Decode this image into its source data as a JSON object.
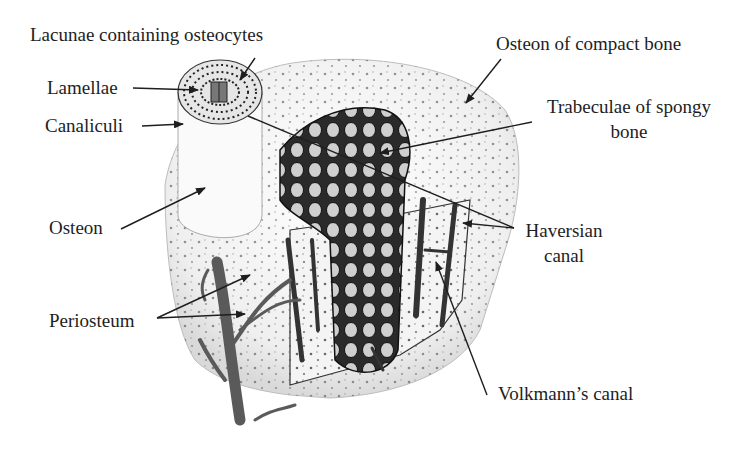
{
  "diagram": {
    "colors": {
      "ink": "#1e1e1e",
      "bone_fill": "#f2f2f2",
      "vessel": "#555555",
      "background": "#ffffff"
    }
  },
  "labels": {
    "lacunae": "Lacunae containing osteocytes",
    "lamellae": "Lamellae",
    "canaliculi": "Canaliculi",
    "osteon": "Osteon",
    "periosteum": "Periosteum",
    "osteon_compact": "Osteon of compact bone",
    "trabeculae_line1": "Trabeculae of spongy",
    "trabeculae_line2": "bone",
    "haversian_line1": "Haversian",
    "haversian_line2": "canal",
    "volkmann": "Volkmann’s canal"
  }
}
